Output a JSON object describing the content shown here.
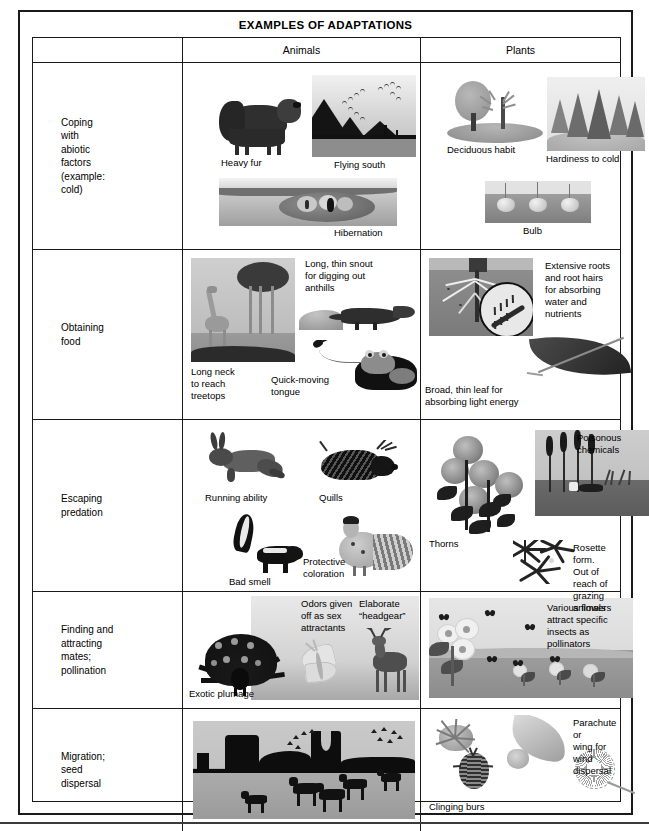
{
  "document": {
    "title": "EXAMPLES OF ADAPTATIONS"
  },
  "table": {
    "columns": [
      {
        "key": "category",
        "label": ""
      },
      {
        "key": "animals",
        "label": "Animals"
      },
      {
        "key": "plants",
        "label": "Plants"
      }
    ],
    "rows": [
      {
        "category": "Coping\nwith\nabiotic\nfactors\n(example:\ncold)",
        "animals": [
          {
            "caption": "Heavy fur",
            "figure": "bison"
          },
          {
            "caption": "Flying south",
            "figure": "migrating-geese"
          },
          {
            "caption": "Hibernation",
            "figure": "hibernating-mammal-burrow"
          }
        ],
        "plants": [
          {
            "caption": "Deciduous habit",
            "figure": "deciduous-tree"
          },
          {
            "caption": "Hardiness to cold",
            "figure": "conifer-forest"
          },
          {
            "caption": "Bulb",
            "figure": "bulbs-underground"
          }
        ]
      },
      {
        "category": "Obtaining\nfood",
        "animals": [
          {
            "caption": "Long neck\nto reach\ntreetops",
            "figure": "giraffe-acacia"
          },
          {
            "caption": "Long, thin snout\nfor digging out\nanthills",
            "figure": "anteater-anthill"
          },
          {
            "caption": "Quick-moving\ntongue",
            "figure": "frog-tongue-fly"
          }
        ],
        "plants": [
          {
            "caption": "Extensive roots\nand root hairs\nfor absorbing\nwater and nutrients",
            "figure": "root-system-magnified"
          },
          {
            "caption": "Broad, thin leaf for\nabsorbing light energy",
            "figure": "broad-leaf"
          }
        ]
      },
      {
        "category": "Escaping\npredation",
        "animals": [
          {
            "caption": "Running ability",
            "figure": "jackrabbit"
          },
          {
            "caption": "Quills",
            "figure": "porcupine"
          },
          {
            "caption": "Bad smell",
            "figure": "skunk"
          },
          {
            "caption": "Protective\ncoloration",
            "figure": "grouse"
          }
        ],
        "plants": [
          {
            "caption": "Thorns",
            "figure": "rose-bush"
          },
          {
            "caption": "Poisonous\nchemicals",
            "figure": "cattails-marsh"
          },
          {
            "caption": "Rosette form.\nOut of reach of\ngrazing animals",
            "figure": "rosette-plants"
          }
        ]
      },
      {
        "category": "Finding and\nattracting\nmates;\npollination",
        "animals": [
          {
            "caption": "Exotic plumage",
            "figure": "peacock"
          },
          {
            "caption": "Odors given\noff as sex\nattractants",
            "figure": "moth"
          },
          {
            "caption": "Elaborate\n“headgear”",
            "figure": "antlered-deer"
          }
        ],
        "plants": [
          {
            "caption": "Various flowers\nattract specific\ninsects as\npollinators",
            "figure": "flowers-with-insects"
          }
        ]
      },
      {
        "category": "Migration;\nseed\ndispersal",
        "animals": [
          {
            "caption": "",
            "figure": "running-horses-mesa-birds"
          }
        ],
        "plants": [
          {
            "caption": "Clinging burs",
            "figure": "burs"
          },
          {
            "caption": "Parachute or\nwing for\nwind dispersal",
            "figure": "winged-seed-and-parachute-seed"
          }
        ]
      }
    ]
  }
}
